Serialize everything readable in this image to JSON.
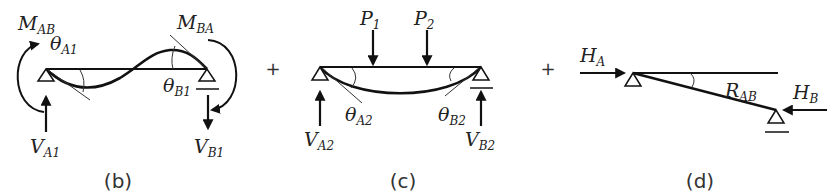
{
  "figure": {
    "panels": [
      {
        "id": "b",
        "caption": "(b)",
        "labels": {
          "moment_a": {
            "main": "M",
            "sub": "AB"
          },
          "moment_b": {
            "main": "M",
            "sub": "BA"
          },
          "theta_a": {
            "main": "θ",
            "sub": "A1"
          },
          "theta_b": {
            "main": "θ",
            "sub": "B1"
          },
          "reaction_a": {
            "main": "V",
            "sub": "A1"
          },
          "reaction_b": {
            "main": "V",
            "sub": "B1"
          }
        }
      },
      {
        "id": "c",
        "caption": "(c)",
        "labels": {
          "load_1": {
            "main": "P",
            "sub": "1"
          },
          "load_2": {
            "main": "P",
            "sub": "2"
          },
          "theta_a": {
            "main": "θ",
            "sub": "A2"
          },
          "theta_b": {
            "main": "θ",
            "sub": "B2"
          },
          "reaction_a": {
            "main": "V",
            "sub": "A2"
          },
          "reaction_b": {
            "main": "V",
            "sub": "B2"
          }
        }
      },
      {
        "id": "d",
        "caption": "(d)",
        "labels": {
          "horizontal_a": {
            "main": "H",
            "sub": "A"
          },
          "horizontal_b": {
            "main": "H",
            "sub": "B"
          },
          "rotation": {
            "main": "R",
            "sub": "AB"
          }
        }
      }
    ],
    "operators": [
      "+",
      "+"
    ]
  }
}
